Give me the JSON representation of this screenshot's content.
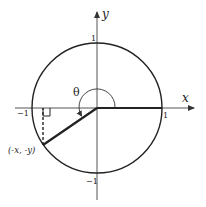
{
  "diagram": {
    "axes": {
      "x_label": "x",
      "y_label": "y"
    },
    "ticks": {
      "y_pos": "1",
      "y_neg": "−1",
      "x_pos": "1",
      "x_neg": "−1"
    },
    "angle_label": "θ",
    "point_label": "(-x, -y)",
    "colors": {
      "stroke": "#222222",
      "axis": "#555555",
      "background": "#ffffff"
    }
  }
}
